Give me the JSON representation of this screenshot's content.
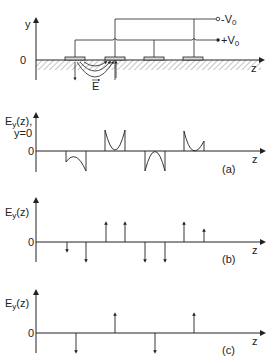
{
  "diagram": {
    "top": {
      "y_axis_label": "y",
      "origin_label": "0",
      "z_axis_label": "z",
      "terminal_neg_label": "-V",
      "terminal_neg_sub": "0",
      "terminal_pos_label": "+V",
      "terminal_pos_sub": "0",
      "field_label": "E",
      "electrodes": 4
    },
    "panel_a": {
      "ylabel_main": "E",
      "ylabel_sub": "y",
      "ylabel_rest": "(z),",
      "ylabel_line2": "y=0",
      "zero_label": "0",
      "z_label": "z",
      "tag": "(a)"
    },
    "panel_b": {
      "ylabel_main": "E",
      "ylabel_sub": "y",
      "ylabel_rest": "(z)",
      "zero_label": "0",
      "z_label": "z",
      "tag": "(b)"
    },
    "panel_c": {
      "ylabel_main": "E",
      "ylabel_sub": "y",
      "ylabel_rest": "(z)",
      "zero_label": "0",
      "z_label": "z",
      "tag": "(c)"
    }
  },
  "colors": {
    "ink": "#222222",
    "electrode_fill": "#d8d8d8"
  }
}
